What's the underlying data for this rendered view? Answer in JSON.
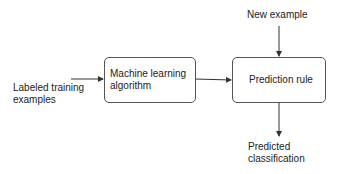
{
  "diagram": {
    "nodes": {
      "input": {
        "line1": "Labeled training",
        "line2": "examples"
      },
      "algorithm": {
        "line1": "Machine learning",
        "line2": "algorithm"
      },
      "rule": {
        "label": "Prediction rule"
      },
      "new_example": {
        "label": "New example"
      },
      "output": {
        "line1": "Predicted",
        "line2": "classification"
      }
    },
    "edges": [
      {
        "from": "input",
        "to": "algorithm"
      },
      {
        "from": "algorithm",
        "to": "rule"
      },
      {
        "from": "new_example",
        "to": "rule"
      },
      {
        "from": "rule",
        "to": "output"
      }
    ],
    "colors": {
      "line": "#333333",
      "box_border": "#555555"
    }
  }
}
